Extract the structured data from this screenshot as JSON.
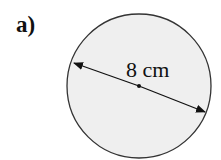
{
  "part_label": "a)",
  "shape": "circle",
  "dimension": {
    "type": "diameter",
    "label": "8 cm"
  },
  "colors": {
    "fill": "#efefef",
    "stroke": "#333333",
    "line": "#111111"
  }
}
